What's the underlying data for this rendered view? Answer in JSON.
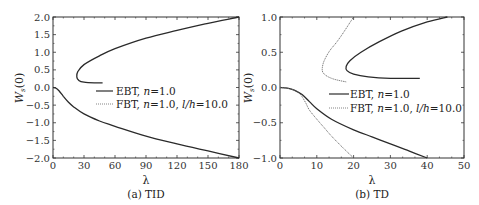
{
  "chart_data": [
    {
      "type": "line",
      "caption": "(a) TID",
      "xlabel": "λ",
      "ylabel": "W_s(0)",
      "xlim": [
        0,
        180
      ],
      "ylim": [
        -2.0,
        2.0
      ],
      "xticks": [
        "0",
        "30",
        "60",
        "90",
        "120",
        "150",
        "180"
      ],
      "yticks": [
        "2.0",
        "1.5",
        "1.0",
        "0.5",
        "0.0",
        "-0.5",
        "-1.0",
        "-1.5",
        "-2.0"
      ],
      "legend": [
        "EBT, n=1.0",
        "FBT, n=1.0, l/h=10.0"
      ],
      "legend_position": "center-right",
      "series": [
        {
          "name": "EBT, n=1.0 (upper branch)",
          "style": "solid",
          "x": [
            48,
            40,
            30,
            25,
            23,
            24,
            30,
            45,
            60,
            90,
            120,
            150,
            180
          ],
          "y": [
            0.13,
            0.13,
            0.15,
            0.2,
            0.3,
            0.45,
            0.65,
            0.9,
            1.1,
            1.4,
            1.62,
            1.82,
            2.0
          ]
        },
        {
          "name": "EBT, n=1.0 (lower branch)",
          "style": "solid",
          "x": [
            0,
            3,
            6,
            10,
            15,
            20,
            30,
            45,
            60,
            90,
            120,
            150,
            180
          ],
          "y": [
            0.0,
            -0.02,
            -0.1,
            -0.25,
            -0.42,
            -0.55,
            -0.75,
            -0.95,
            -1.1,
            -1.38,
            -1.6,
            -1.8,
            -2.0
          ]
        },
        {
          "name": "FBT, n=1.0, l/h=10.0",
          "style": "dotted",
          "note": "overlaps EBT curves",
          "x": [],
          "y": []
        }
      ]
    },
    {
      "type": "line",
      "caption": "(b) TD",
      "xlabel": "λ",
      "ylabel": "W_s(0)",
      "xlim": [
        0,
        50
      ],
      "ylim": [
        -1.0,
        1.0
      ],
      "xticks": [
        "0",
        "10",
        "20",
        "30",
        "40",
        "50"
      ],
      "yticks": [
        "1.0",
        "0.5",
        "0.0",
        "-0.5",
        "-1.0"
      ],
      "legend": [
        "EBT, n=1.0",
        "FBT, n=1.0, l/h=10.0"
      ],
      "legend_position": "center-right",
      "series": [
        {
          "name": "EBT, n=1.0 (upper branch)",
          "style": "solid",
          "x": [
            38,
            30,
            24,
            20,
            18.2,
            18,
            19,
            22,
            27,
            33,
            40,
            45.5
          ],
          "y": [
            0.13,
            0.13,
            0.15,
            0.19,
            0.24,
            0.3,
            0.38,
            0.5,
            0.65,
            0.8,
            0.93,
            1.0
          ]
        },
        {
          "name": "EBT, n=1.0 (lower branch)",
          "style": "solid",
          "x": [
            0,
            2,
            4,
            6,
            8,
            10,
            14,
            20,
            25,
            30,
            35,
            40
          ],
          "y": [
            0.0,
            -0.01,
            -0.04,
            -0.1,
            -0.2,
            -0.3,
            -0.45,
            -0.6,
            -0.7,
            -0.8,
            -0.9,
            -1.0
          ]
        },
        {
          "name": "FBT, n=1.0, l/h=10.0 (upper branch)",
          "style": "dotted",
          "x": [
            18,
            16,
            14,
            12.5,
            11.6,
            11.5,
            12,
            13.5,
            15.5,
            17.5,
            19,
            20
          ],
          "y": [
            0.08,
            0.1,
            0.13,
            0.17,
            0.22,
            0.28,
            0.38,
            0.52,
            0.65,
            0.8,
            0.92,
            1.0
          ]
        },
        {
          "name": "FBT, n=1.0, l/h=10.0 (lower branch)",
          "style": "dotted",
          "x": [
            0,
            2,
            4,
            5,
            6,
            7,
            8,
            10,
            12,
            14,
            17,
            20
          ],
          "y": [
            0.0,
            -0.01,
            -0.04,
            -0.07,
            -0.13,
            -0.22,
            -0.32,
            -0.45,
            -0.57,
            -0.69,
            -0.85,
            -1.0
          ]
        }
      ]
    }
  ],
  "panel_a": {
    "caption": "(a) TID",
    "xlabel": "λ",
    "ylabel_main": "W",
    "ylabel_sub": "s",
    "ylabel_tail": "(0)",
    "legend_ebt": "EBT, ",
    "legend_fbt": "FBT, ",
    "legend_n": "n",
    "legend_nval": "=1.0",
    "legend_nval2": "=1.0, ",
    "legend_lh": "l/h",
    "legend_lhval": "=10.0"
  },
  "panel_b": {
    "caption": "(b) TD",
    "xlabel": "λ",
    "ylabel_main": "W",
    "ylabel_sub": "s",
    "ylabel_tail": "(0)",
    "legend_ebt": "EBT, ",
    "legend_fbt": "FBT, ",
    "legend_n": "n",
    "legend_nval": "=1.0",
    "legend_nval2": "=1.0, ",
    "legend_lh": "l/h",
    "legend_lhval": "=10.0"
  },
  "colors": {
    "ebt_line": "#2a2a2a",
    "fbt_line": "#666666",
    "axis": "#333333"
  }
}
